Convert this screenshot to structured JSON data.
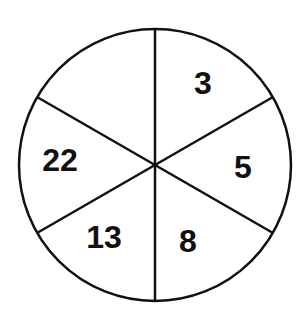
{
  "diagram": {
    "type": "divided-circle",
    "sections": 6,
    "colors": {
      "stroke": "#111111",
      "fill": "#ffffff",
      "text": "#111111"
    },
    "labels": [
      {
        "position": "top-right",
        "value": "3"
      },
      {
        "position": "right",
        "value": "5"
      },
      {
        "position": "bottom-right",
        "value": "8"
      },
      {
        "position": "bottom-left",
        "value": "13"
      },
      {
        "position": "left",
        "value": "22"
      },
      {
        "position": "top-left",
        "value": ""
      }
    ]
  }
}
